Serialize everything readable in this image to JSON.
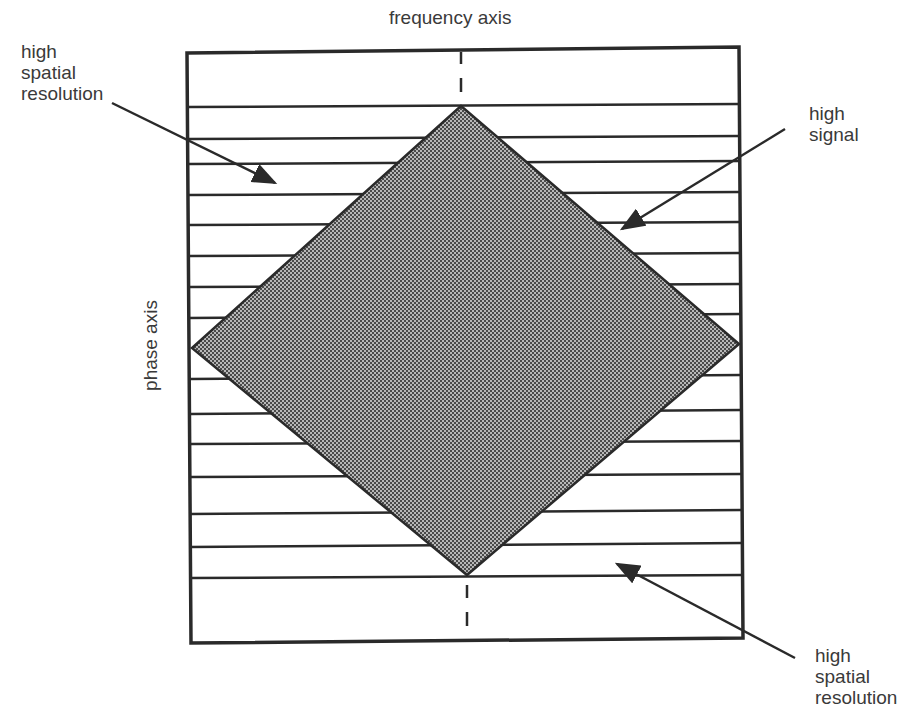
{
  "diagram": {
    "top_axis_label": "frequency axis",
    "side_axis_label": "phase axis",
    "annotations": [
      {
        "id": "top-left",
        "text": "high\nspatial\nresolution"
      },
      {
        "id": "right",
        "text": "high\nsignal"
      },
      {
        "id": "bottom-right",
        "text": "high\nspatial\nresolution"
      }
    ],
    "colors": {
      "line": "#2a2a2a",
      "diamond_fill": "#8a8a8a",
      "background": "#ffffff"
    }
  }
}
